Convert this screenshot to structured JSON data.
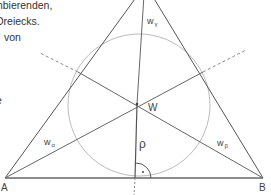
{
  "text": {
    "lines": [
      "mbierenden,",
      "Dreiecks.",
      "von"
    ],
    "line_offsets": [
      2,
      -6,
      4
    ],
    "fragment": "e"
  },
  "diagram": {
    "labels": {
      "vertex_a": "A",
      "vertex_b": "B",
      "incenter": "W",
      "inradius": "ρ",
      "bisector_alpha": "w",
      "bisector_alpha_sub": "α",
      "bisector_beta": "w",
      "bisector_beta_sub": "β",
      "bisector_gamma": "w",
      "bisector_gamma_sub": "γ"
    },
    "colors": {
      "line": "#555555",
      "circle": "#bbbbbb",
      "dashed": "#888888"
    }
  }
}
